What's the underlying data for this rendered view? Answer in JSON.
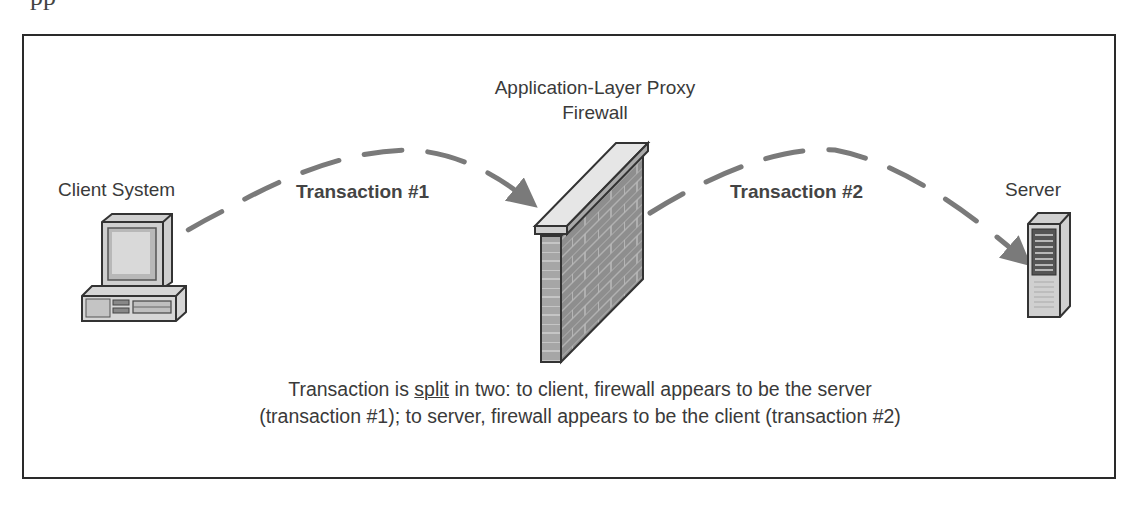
{
  "header": {
    "cutoff_heading": "pp"
  },
  "diagram": {
    "nodes": [
      {
        "id": "client",
        "label": "Client System",
        "icon": "desktop-computer-icon"
      },
      {
        "id": "firewall",
        "label_line1": "Application-Layer Proxy",
        "label_line2": "Firewall",
        "icon": "brick-wall-icon"
      },
      {
        "id": "server",
        "label": "Server",
        "icon": "tower-server-icon"
      }
    ],
    "edges": [
      {
        "from": "client",
        "to": "firewall",
        "label": "Transaction #1",
        "style": "dashed-arrow"
      },
      {
        "from": "firewall",
        "to": "server",
        "label": "Transaction #2",
        "style": "dashed-arrow"
      }
    ],
    "caption": {
      "part1": "Transaction is ",
      "emphasis": "split",
      "part2": " in two: to client, firewall appears to be the server",
      "line2": "(transaction #1); to server, firewall appears to be the client (transaction #2)"
    }
  },
  "colors": {
    "arrow": "#7a7a7a",
    "frame": "#2a2a2a",
    "wall_face": "#8c8c8c",
    "wall_cap": "#e4e4e4",
    "text": "#3a3a3a"
  }
}
